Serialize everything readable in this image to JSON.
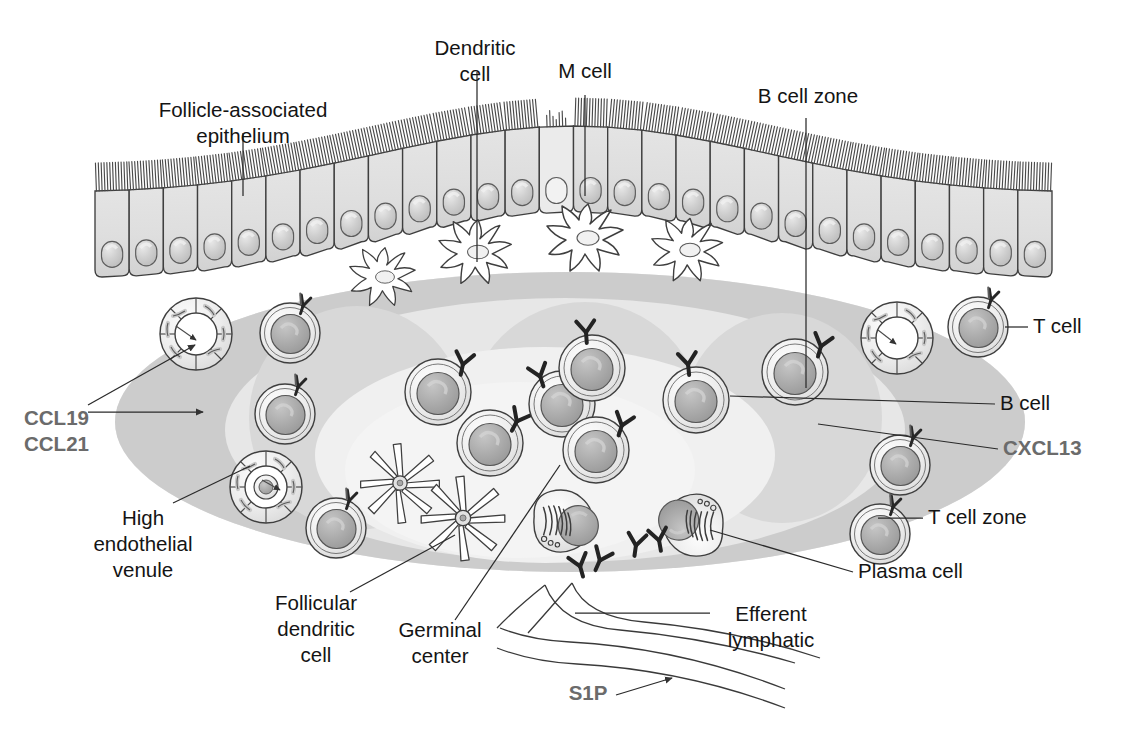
{
  "figure": {
    "domain_note": "Immunology schematic of follicle-associated epithelium and underlying lymphoid follicle"
  },
  "colors": {
    "ink": "#3a3a3a",
    "label_text": "#141414",
    "chemokine_text": "#6b6b6b",
    "t_cell_zone_fill": "#cfcfcf",
    "follicle_fill": "#e6e6e6",
    "b_cell_zone_fill": "#d6d6d6",
    "germinal_center_fill": "#efefef",
    "epithelium_fill": "#dcdcdc",
    "nucleus_fill": "#b4b4b4",
    "lumen_white": "#ffffff",
    "antibody_dark": "#2b2b2b"
  },
  "labels": [
    {
      "id": "follicle-associated-epithelium",
      "text_lines": [
        "Follicle-associated",
        "epithelium"
      ],
      "style": "plain",
      "anchor": "middle",
      "x": 243,
      "y": 117
    },
    {
      "id": "dendritic-cell",
      "text_lines": [
        "Dendritic",
        "cell"
      ],
      "style": "plain",
      "anchor": "middle",
      "x": 475,
      "y": 55
    },
    {
      "id": "m-cell",
      "text_lines": [
        "M cell"
      ],
      "style": "plain",
      "anchor": "middle",
      "x": 585,
      "y": 78
    },
    {
      "id": "b-cell-zone",
      "text_lines": [
        "B cell zone"
      ],
      "style": "plain",
      "anchor": "middle",
      "x": 808,
      "y": 103
    },
    {
      "id": "t-cell",
      "text_lines": [
        "T cell"
      ],
      "style": "plain",
      "anchor": "start",
      "x": 1033,
      "y": 333
    },
    {
      "id": "b-cell",
      "text_lines": [
        "B cell"
      ],
      "style": "plain",
      "anchor": "start",
      "x": 1000,
      "y": 410
    },
    {
      "id": "cxcl13",
      "text_lines": [
        "CXCL13"
      ],
      "style": "chemokine",
      "anchor": "start",
      "x": 1003,
      "y": 455
    },
    {
      "id": "t-cell-zone",
      "text_lines": [
        "T cell zone"
      ],
      "style": "plain",
      "anchor": "start",
      "x": 928,
      "y": 524
    },
    {
      "id": "plasma-cell",
      "text_lines": [
        "Plasma cell"
      ],
      "style": "plain",
      "anchor": "start",
      "x": 858,
      "y": 578
    },
    {
      "id": "efferent-lymphatic",
      "text_lines": [
        "Efferent",
        "lymphatic"
      ],
      "style": "plain",
      "anchor": "middle",
      "x": 771,
      "y": 621
    },
    {
      "id": "ccl19-ccl21",
      "text_lines": [
        "CCL19",
        "CCL21"
      ],
      "style": "chemokine",
      "anchor": "start",
      "x": 24,
      "y": 425
    },
    {
      "id": "high-endothelial-venule",
      "text_lines": [
        "High",
        "endothelial",
        "venule"
      ],
      "style": "plain",
      "anchor": "middle",
      "x": 143,
      "y": 525
    },
    {
      "id": "follicular-dendritic-cell",
      "text_lines": [
        "Follicular",
        "dendritic",
        "cell"
      ],
      "style": "plain",
      "anchor": "middle",
      "x": 316,
      "y": 610
    },
    {
      "id": "germinal-center",
      "text_lines": [
        "Germinal",
        "center"
      ],
      "style": "plain",
      "anchor": "middle",
      "x": 440,
      "y": 637
    },
    {
      "id": "s1p",
      "text_lines": [
        "S1P"
      ],
      "style": "chemokine",
      "anchor": "middle",
      "x": 588,
      "y": 700
    }
  ],
  "structures": [
    {
      "id": "t-cell-zone-region",
      "name": "T cell zone",
      "shape": "ellipse",
      "fill": "#cfcfcf"
    },
    {
      "id": "follicle-region",
      "name": "Follicle / germinal center",
      "shape": "ellipse",
      "fill": "#e9e9e9"
    },
    {
      "id": "b-cell-zone-regions",
      "name": "B cell zones",
      "count": 3,
      "shape": "ellipse",
      "fill": "#d8d8d8"
    },
    {
      "id": "germinal-center-region",
      "name": "Germinal center",
      "shape": "ellipse",
      "fill": "#f1f1f1"
    },
    {
      "id": "epithelium",
      "name": "Follicle-associated epithelium",
      "cell_count": 28,
      "fill": "#dcdcdc"
    },
    {
      "id": "efferent-lymphatic-vessel",
      "name": "Efferent lymphatic",
      "shape": "tubes",
      "count": 2
    }
  ],
  "cell_counts": {
    "epithelial_cells": 28,
    "m_cells": 1,
    "dendritic_cells": 4,
    "follicular_dendritic_cells": 2,
    "high_endothelial_venules": 3,
    "t_cells": 6,
    "b_cells": 7,
    "plasma_cells": 2
  },
  "legend_note": {
    "chemokine_items": [
      "CCL19",
      "CCL21",
      "CXCL13",
      "S1P"
    ],
    "cell_items": [
      "T cell",
      "B cell",
      "Plasma cell",
      "Dendritic cell",
      "Follicular dendritic cell",
      "M cell"
    ]
  }
}
